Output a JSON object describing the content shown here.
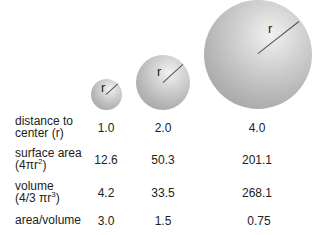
{
  "spheres": [
    {
      "radius_label": "r",
      "r_value": "1.0",
      "surface_area": "12.6",
      "volume": "4.2",
      "ratio": "3.0"
    },
    {
      "radius_label": "r",
      "r_value": "2.0",
      "surface_area": "50.3",
      "volume": "33.5",
      "ratio": "1.5"
    },
    {
      "radius_label": "r",
      "r_value": "4.0",
      "surface_area": "201.1",
      "volume": "268.1",
      "ratio": "0.75"
    }
  ],
  "rows": {
    "distance": {
      "line1": "distance to",
      "line2": "center (r)"
    },
    "surface": {
      "line1": "surface area",
      "line2_pre": "(4πr",
      "line2_sup": "2",
      "line2_post": ")"
    },
    "volume": {
      "line1": "volume",
      "line2_pre": "(4/3 πr",
      "line2_sup": "3",
      "line2_post": ")"
    },
    "ratio": {
      "line1": "area/volume"
    }
  }
}
